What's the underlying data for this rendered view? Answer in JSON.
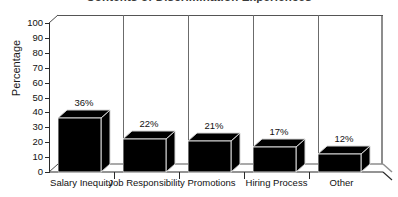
{
  "chart_data": {
    "type": "bar",
    "title": "Contents of Discrimination Experiences",
    "xlabel": "",
    "ylabel": "Percentage",
    "ylim": [
      0,
      100
    ],
    "yticks": [
      0,
      10,
      20,
      30,
      40,
      50,
      60,
      70,
      80,
      90,
      100
    ],
    "grid": false,
    "legend": false,
    "style": "3d-block-bars",
    "categories": [
      "Salary Inequity",
      "Job Responsibility",
      "Promotions",
      "Hiring Process",
      "Other"
    ],
    "values": [
      36,
      22,
      21,
      17,
      12
    ],
    "data_labels": [
      "36%",
      "22%",
      "21%",
      "17%",
      "12%"
    ],
    "colors": {
      "bar_face": "#000000",
      "bar_highlight": "#d6d6d6",
      "axis": "#2a2a2a",
      "frame": "#8d8d8d",
      "background": "#ffffff",
      "text": "#111111"
    }
  }
}
